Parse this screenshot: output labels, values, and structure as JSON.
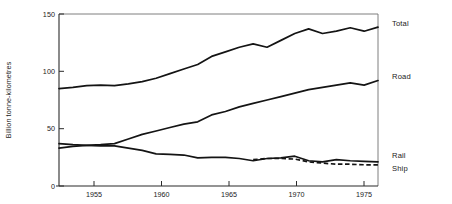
{
  "chart_data": {
    "type": "line",
    "title": "",
    "subtitle": "",
    "xlabel": "",
    "ylabel": "Billion tonne-kilometres",
    "xlim": [
      1953,
      1976
    ],
    "ylim": [
      0,
      150
    ],
    "grid": false,
    "legend_position": "right-inline-labels",
    "x_ticks": [
      1955,
      1960,
      1965,
      1970,
      1975
    ],
    "x_tick_labels": [
      "1955",
      "1960",
      "1965",
      "1970",
      "1975"
    ],
    "y_ticks": [
      0,
      50,
      100,
      150
    ],
    "y_tick_labels": [
      "0",
      "50",
      "100",
      "150"
    ],
    "x": [
      1953,
      1954,
      1955,
      1956,
      1957,
      1958,
      1959,
      1960,
      1961,
      1962,
      1963,
      1964,
      1965,
      1966,
      1967,
      1968,
      1969,
      1970,
      1971,
      1972,
      1973,
      1974,
      1975,
      1976
    ],
    "series": [
      {
        "name": "Total",
        "label": "Total",
        "style": "solid",
        "values": [
          85,
          86,
          87.5,
          88,
          87.5,
          89,
          91,
          94,
          98,
          102,
          106,
          113,
          117,
          121,
          124,
          121,
          127,
          133,
          137,
          133,
          135,
          138,
          135,
          138.5
        ]
      },
      {
        "name": "Road",
        "label": "Road",
        "style": "solid",
        "values": [
          33,
          34.5,
          35.5,
          36,
          37,
          41,
          45,
          48,
          51,
          54,
          56,
          62,
          65,
          69,
          72,
          75,
          78,
          81,
          84,
          86,
          88,
          90,
          88,
          92
        ]
      },
      {
        "name": "Rail",
        "label": "Rail",
        "style": "solid",
        "values": [
          37,
          36,
          35.5,
          35,
          35,
          33,
          31,
          28,
          27.5,
          27,
          24.5,
          25,
          25,
          24,
          22,
          24,
          24.5,
          26,
          22,
          21,
          23,
          22,
          21.5,
          21
        ]
      },
      {
        "name": "Ship",
        "label": "Ship",
        "style": "dashed",
        "values": [
          null,
          null,
          null,
          null,
          null,
          null,
          null,
          null,
          null,
          null,
          null,
          null,
          null,
          null,
          23,
          24,
          24,
          23.5,
          21,
          20,
          19,
          19,
          18.5,
          18.5
        ]
      }
    ],
    "annotations": []
  },
  "axes": {
    "y_axis_title": "Billion tonne-kilometres"
  }
}
